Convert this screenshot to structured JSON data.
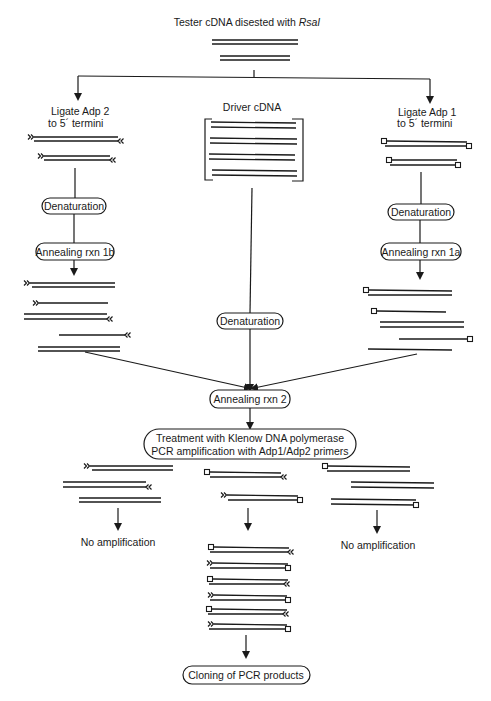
{
  "title": {
    "text": "Tester cDNA disested with ",
    "italic": "RsaI"
  },
  "branches": {
    "left": {
      "label_line1": "Ligate Adp 2",
      "label_line2": "to 5´ termini",
      "step1": "Denaturation",
      "step2": "Annealing rxn 1b"
    },
    "middle": {
      "label": "Driver cDNA",
      "step1": "Denaturation"
    },
    "right": {
      "label_line1": "Ligate Adp 1",
      "label_line2": "to 5´ termini",
      "step1": "Denaturation",
      "step2": "Annealing rxn 1a"
    }
  },
  "merge": {
    "step": "Annealing rxn 2"
  },
  "treatment": {
    "line1": "Treatment with Klenow DNA polymerase",
    "line2": "PCR amplification with Adp1/Adp2 primers"
  },
  "outcomes": {
    "left": "No amplification",
    "right": "No amplification",
    "final": "Cloning of PCR products"
  },
  "legend_symbols": {
    "adp2_end": "double-chevron",
    "adp1_end": "open-square"
  }
}
